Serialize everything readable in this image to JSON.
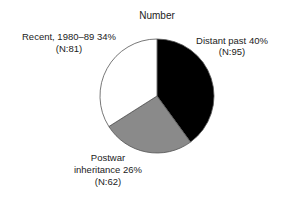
{
  "chart_data": {
    "type": "pie",
    "title": "Number",
    "start": "12 o'clock",
    "direction": "clockwise",
    "slices": [
      {
        "label": "Distant past",
        "percent": 40,
        "n": 95,
        "color": "#000000",
        "label_line1": "Distant past 40%",
        "label_line2": "(N:95)"
      },
      {
        "label": "Postwar inheritance",
        "percent": 26,
        "n": 62,
        "color": "#8a8a8a",
        "label_line1": "Postwar",
        "label_line2": "inheritance 26%",
        "label_line3": "(N:62)"
      },
      {
        "label": "Recent, 1980–89",
        "percent": 34,
        "n": 81,
        "color": "#ffffff",
        "label_line1": "Recent, 1980–89 34%",
        "label_line2": "(N:81)"
      }
    ]
  }
}
